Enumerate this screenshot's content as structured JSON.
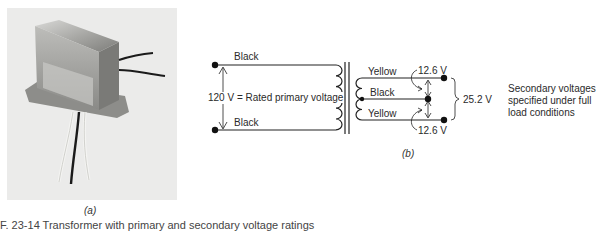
{
  "figure": {
    "panel_a": {
      "label": "(a)",
      "image": "transformer-photo"
    },
    "panel_b": {
      "label": "(b)",
      "primary": {
        "top_lead": "Black",
        "bottom_lead": "Black",
        "voltage_label": "120 V = Rated primary voltage"
      },
      "secondary": {
        "top_lead": "Yellow",
        "center_tap": "Black",
        "bottom_lead": "Yellow",
        "upper_voltage": "12.6 V",
        "lower_voltage": "12.6 V",
        "total_voltage": "25.2 V",
        "note_lines": [
          "Secondary voltages",
          "specified under full",
          "load conditions"
        ]
      }
    },
    "caption_partial": "F. 23-14   Transformer with primary and secondary voltage ratings"
  }
}
